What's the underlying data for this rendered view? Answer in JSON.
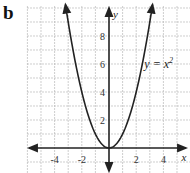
{
  "panel_label": "b",
  "chart_data": {
    "type": "line",
    "title": "",
    "xlabel": "x",
    "ylabel": "y",
    "xlim": [
      -6,
      6
    ],
    "ylim": [
      -1.8,
      10.4
    ],
    "grid": true,
    "grid_step": 1,
    "x_ticks": [
      -4,
      -2,
      2,
      4
    ],
    "y_ticks": [
      2,
      4,
      6,
      8
    ],
    "x_tick_labels": [
      "-4",
      "-2",
      "2",
      "4"
    ],
    "y_tick_labels": [
      "2",
      "4",
      "6",
      "8"
    ],
    "series": [
      {
        "name": "y = x^2",
        "function": "x^2",
        "x_range": [
          -3.2,
          3.2
        ]
      }
    ],
    "annotations": [
      {
        "text_main": "y = x",
        "text_sup": "2",
        "x": 2.6,
        "y": 6
      }
    ]
  }
}
